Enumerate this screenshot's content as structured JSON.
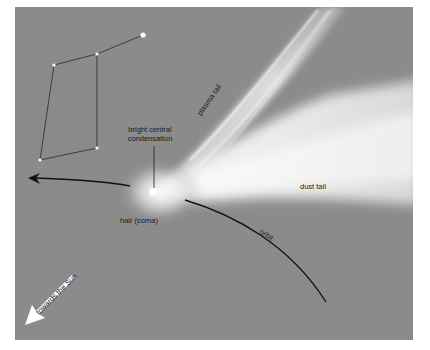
{
  "labels": {
    "condensation_line1": "bright central",
    "condensation_line2": "condensation",
    "plasma_tail": "plasma tail",
    "dust_tail": "dust tail",
    "coma": "hair (coma)",
    "orbit": "orbit",
    "sun_direction": "towards the Sun"
  },
  "colors": {
    "background": "#8b8b8b",
    "tail": "#f2f2f2",
    "lines": "#111111"
  },
  "constellation": {
    "stars": [
      {
        "x": 143,
        "y": 35,
        "r": 2.6
      },
      {
        "x": 97,
        "y": 54,
        "r": 1.6
      },
      {
        "x": 54,
        "y": 65,
        "r": 1.6
      },
      {
        "x": 97,
        "y": 148,
        "r": 1.6
      },
      {
        "x": 40,
        "y": 160,
        "r": 1.6
      }
    ]
  }
}
